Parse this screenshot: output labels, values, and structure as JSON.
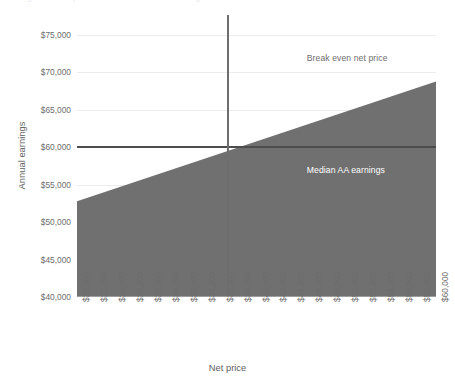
{
  "figure": {
    "cropped_title_fragment": "Figure: Net price versus annual earnings"
  },
  "chart_data": {
    "type": "area",
    "title": "",
    "xlabel": "Net price",
    "ylabel": "Annual earnings",
    "xlim": [
      20000,
      60000
    ],
    "ylim": [
      40000,
      75000
    ],
    "grid": true,
    "legend_position": "none",
    "x_tick_labels": [
      "$20,000",
      "$22,000",
      "$24,000",
      "$26,000",
      "$28,000",
      "$30,000",
      "$32,000",
      "$34,000",
      "$36,000",
      "$38,000",
      "$40,000",
      "$42,000",
      "$44,000",
      "$46,000",
      "$48,000",
      "$50,000",
      "$52,000",
      "$54,000",
      "$56,000",
      "$58,000",
      "$60,000"
    ],
    "x_tick_values": [
      20000,
      22000,
      24000,
      26000,
      28000,
      30000,
      32000,
      34000,
      36000,
      38000,
      40000,
      42000,
      44000,
      46000,
      48000,
      50000,
      52000,
      54000,
      56000,
      58000,
      60000
    ],
    "y_tick_labels": [
      "$40,000",
      "$45,000",
      "$50,000",
      "$55,000",
      "$60,000",
      "$65,000",
      "$70,000",
      "$75,000"
    ],
    "y_tick_values": [
      40000,
      45000,
      50000,
      55000,
      60000,
      65000,
      70000,
      75000
    ],
    "series": [
      {
        "name": "Break even earnings",
        "type": "area",
        "fill_color": "#707070",
        "x": [
          20000,
          60000
        ],
        "values": [
          52800,
          68800
        ]
      }
    ],
    "reference_lines": [
      {
        "name": "Break even net price",
        "orientation": "vertical",
        "value": 36800,
        "color": "#6e6e6e",
        "label": "Break even net price",
        "label_color": "#6d6d6d"
      },
      {
        "name": "Median AA earnings",
        "orientation": "horizontal",
        "value": 60000,
        "color": "#4d4d4d",
        "label": "Median AA earnings",
        "label_color": "#ffffff"
      }
    ],
    "annotations": [
      {
        "text": "Break even net price",
        "x": 45600,
        "y": 72600
      },
      {
        "text": "Median AA earnings",
        "x": 45600,
        "y": 57600
      }
    ]
  },
  "colors": {
    "area_fill": "#707070",
    "gridline": "#ececed",
    "axis_line": "#9d9d9d",
    "tick_text": "#6d6d6d",
    "axis_title": "#5f5f5f",
    "background": "#ffffff"
  }
}
